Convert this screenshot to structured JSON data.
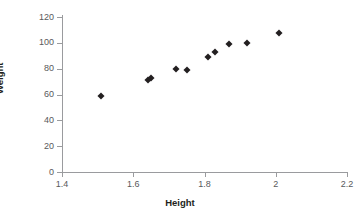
{
  "chart_data": {
    "type": "scatter",
    "title": "",
    "xlabel": "Height",
    "ylabel": "Weight",
    "xlim": [
      1.4,
      2.2
    ],
    "ylim": [
      0,
      120
    ],
    "grid": false,
    "legend": null,
    "x_ticks": [
      "1.4",
      "1.6",
      "1.8",
      "2",
      "2.2"
    ],
    "x_tick_values": [
      1.4,
      1.6,
      1.8,
      2.0,
      2.2
    ],
    "y_ticks": [
      "0",
      "20",
      "40",
      "60",
      "80",
      "100",
      "120"
    ],
    "y_tick_values": [
      0,
      20,
      40,
      60,
      80,
      100,
      120
    ],
    "marker": "diamond",
    "marker_color": "#231f20",
    "points": [
      {
        "x": 1.51,
        "y": 59
      },
      {
        "x": 1.64,
        "y": 71
      },
      {
        "x": 1.65,
        "y": 73
      },
      {
        "x": 1.72,
        "y": 80
      },
      {
        "x": 1.75,
        "y": 79
      },
      {
        "x": 1.81,
        "y": 89
      },
      {
        "x": 1.83,
        "y": 93
      },
      {
        "x": 1.87,
        "y": 99
      },
      {
        "x": 1.92,
        "y": 100
      },
      {
        "x": 2.01,
        "y": 108
      }
    ],
    "x": [
      1.51,
      1.64,
      1.65,
      1.72,
      1.75,
      1.81,
      1.83,
      1.87,
      1.92,
      2.01
    ],
    "values": [
      59,
      71,
      73,
      80,
      79,
      89,
      93,
      99,
      100,
      108
    ]
  },
  "style": {
    "axis_color": "#9a9b9e",
    "tick_label_color": "#58595b",
    "axis_title_color": "#231f20",
    "background": "#ffffff"
  }
}
